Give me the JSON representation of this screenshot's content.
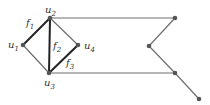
{
  "diagram": {
    "type": "graph",
    "colors": {
      "edge": "#6e6e6e",
      "edge_bold": "#222222",
      "node": "#555555",
      "label": "#333333"
    },
    "nodes": [
      {
        "id": "u1",
        "label": "u",
        "sub": "1",
        "x": 23,
        "y": 45
      },
      {
        "id": "u2",
        "label": "u",
        "sub": "2",
        "x": 50,
        "y": 18
      },
      {
        "id": "u3",
        "label": "u",
        "sub": "3",
        "x": 49,
        "y": 73
      },
      {
        "id": "u4",
        "label": "u",
        "sub": "4",
        "x": 78,
        "y": 45
      },
      {
        "id": "r1",
        "label": "",
        "x": 175,
        "y": 18
      },
      {
        "id": "r2",
        "label": "",
        "x": 149,
        "y": 46
      },
      {
        "id": "r3",
        "label": "",
        "x": 175,
        "y": 73
      },
      {
        "id": "r4",
        "label": "",
        "x": 199,
        "y": 99
      }
    ],
    "edges": [
      {
        "from": "u1",
        "to": "u2",
        "bold": true
      },
      {
        "from": "u2",
        "to": "u3",
        "bold": true
      },
      {
        "from": "u3",
        "to": "u4",
        "bold": true
      },
      {
        "from": "u1",
        "to": "u3",
        "bold": false
      },
      {
        "from": "u2",
        "to": "u4",
        "bold": false
      },
      {
        "from": "u2",
        "to": "r1",
        "bold": false
      },
      {
        "from": "u3",
        "to": "r3",
        "bold": false
      },
      {
        "from": "r1",
        "to": "r2",
        "bold": false
      },
      {
        "from": "r2",
        "to": "r3",
        "bold": false
      },
      {
        "from": "r3",
        "to": "r4",
        "bold": false
      }
    ],
    "face_labels": [
      {
        "label": "f",
        "sub": "1",
        "x": 26,
        "y": 26
      },
      {
        "label": "f",
        "sub": "2",
        "x": 53,
        "y": 49
      },
      {
        "label": "f",
        "sub": "3",
        "x": 66,
        "y": 66
      }
    ]
  }
}
